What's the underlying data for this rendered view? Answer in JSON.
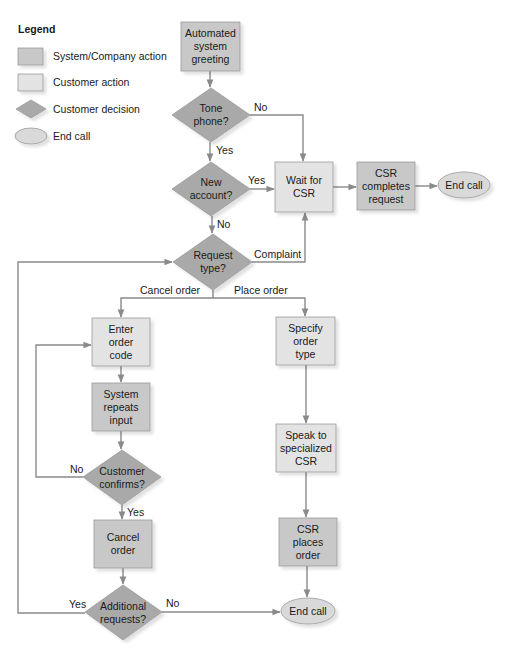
{
  "colors": {
    "system_action": "#c8c8c8",
    "customer_action": "#e3e3e3",
    "customer_decision": "#a9a9a9",
    "end_call": "#d9d9d9",
    "border": "#9a9a9a",
    "edge": "#8a8a8a"
  },
  "legend": {
    "title": "Legend",
    "items": [
      {
        "shape": "system-action-rect",
        "label": "System/Company action"
      },
      {
        "shape": "customer-action-rect",
        "label": "Customer action"
      },
      {
        "shape": "decision-diamond",
        "label": "Customer decision"
      },
      {
        "shape": "end-ellipse",
        "label": "End call"
      }
    ]
  },
  "nodes": {
    "greeting": {
      "type": "system_action",
      "lines": [
        "Automated",
        "system",
        "greeting"
      ]
    },
    "tone_phone": {
      "type": "customer_decision",
      "lines": [
        "Tone",
        "phone?"
      ]
    },
    "new_account": {
      "type": "customer_decision",
      "lines": [
        "New",
        "account?"
      ]
    },
    "wait_csr": {
      "type": "customer_action",
      "lines": [
        "Wait for",
        "CSR"
      ]
    },
    "csr_completes": {
      "type": "system_action",
      "lines": [
        "CSR",
        "completes",
        "request"
      ]
    },
    "end_call_top": {
      "type": "end_call",
      "lines": [
        "End call"
      ]
    },
    "request_type": {
      "type": "customer_decision",
      "lines": [
        "Request",
        "type?"
      ]
    },
    "enter_order_code": {
      "type": "customer_action",
      "lines": [
        "Enter",
        "order",
        "code"
      ]
    },
    "system_repeats": {
      "type": "system_action",
      "lines": [
        "System",
        "repeats",
        "input"
      ]
    },
    "customer_confirms": {
      "type": "customer_decision",
      "lines": [
        "Customer",
        "confirms?"
      ]
    },
    "cancel_order": {
      "type": "system_action",
      "lines": [
        "Cancel",
        "order"
      ]
    },
    "additional_requests": {
      "type": "customer_decision",
      "lines": [
        "Additional",
        "requests?"
      ]
    },
    "specify_order_type": {
      "type": "customer_action",
      "lines": [
        "Specify",
        "order",
        "type"
      ]
    },
    "speak_specialized": {
      "type": "customer_action",
      "lines": [
        "Speak to",
        "specialized",
        "CSR"
      ]
    },
    "csr_places": {
      "type": "system_action",
      "lines": [
        "CSR",
        "places",
        "order"
      ]
    },
    "end_call_bottom": {
      "type": "end_call",
      "lines": [
        "End call"
      ]
    }
  },
  "edge_labels": {
    "tone_no": "No",
    "tone_yes": "Yes",
    "new_yes": "Yes",
    "new_no": "No",
    "complaint": "Complaint",
    "cancel_order": "Cancel order",
    "place_order": "Place order",
    "confirms_no": "No",
    "confirms_yes": "Yes",
    "additional_yes": "Yes",
    "additional_no": "No"
  },
  "edges": [
    {
      "from": "greeting",
      "to": "tone_phone"
    },
    {
      "from": "tone_phone",
      "to": "wait_csr",
      "label": "No"
    },
    {
      "from": "tone_phone",
      "to": "new_account",
      "label": "Yes"
    },
    {
      "from": "new_account",
      "to": "wait_csr",
      "label": "Yes"
    },
    {
      "from": "new_account",
      "to": "request_type",
      "label": "No"
    },
    {
      "from": "wait_csr",
      "to": "csr_completes"
    },
    {
      "from": "csr_completes",
      "to": "end_call_top"
    },
    {
      "from": "request_type",
      "to": "wait_csr",
      "label": "Complaint"
    },
    {
      "from": "request_type",
      "to": "enter_order_code",
      "label": "Cancel order"
    },
    {
      "from": "request_type",
      "to": "specify_order_type",
      "label": "Place order"
    },
    {
      "from": "enter_order_code",
      "to": "system_repeats"
    },
    {
      "from": "system_repeats",
      "to": "customer_confirms"
    },
    {
      "from": "customer_confirms",
      "to": "enter_order_code",
      "label": "No"
    },
    {
      "from": "customer_confirms",
      "to": "cancel_order",
      "label": "Yes"
    },
    {
      "from": "cancel_order",
      "to": "additional_requests"
    },
    {
      "from": "additional_requests",
      "to": "request_type",
      "label": "Yes"
    },
    {
      "from": "additional_requests",
      "to": "end_call_bottom",
      "label": "No"
    },
    {
      "from": "specify_order_type",
      "to": "speak_specialized"
    },
    {
      "from": "speak_specialized",
      "to": "csr_places"
    },
    {
      "from": "csr_places",
      "to": "end_call_bottom"
    }
  ]
}
